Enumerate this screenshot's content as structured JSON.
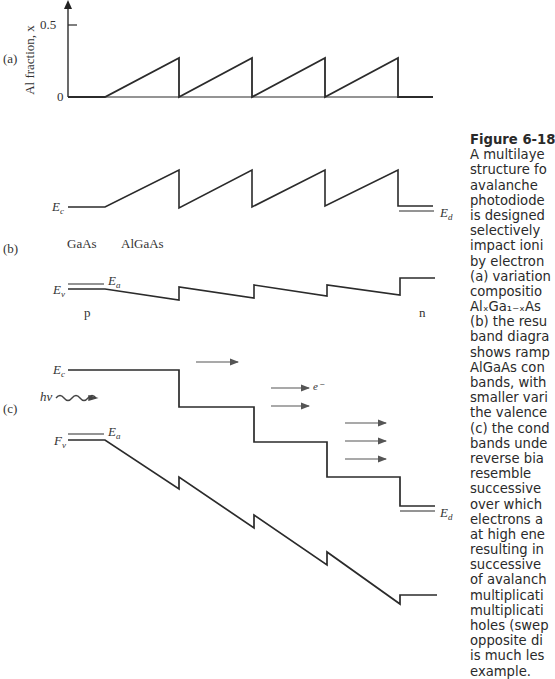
{
  "panel_a": {
    "label": "(a)",
    "ylabel": "Al fraction, x",
    "tick_half": "0.5",
    "tick_zero": "0"
  },
  "panel_b": {
    "label": "(b)",
    "Ec": "E",
    "Ec_sub": "c",
    "Ev": "E",
    "Ev_sub": "v",
    "Ea": "E",
    "Ea_sub": "a",
    "Ed": "E",
    "Ed_sub": "d",
    "region_gaas": "GaAs",
    "region_algaas": "AlGaAs",
    "region_p": "p",
    "region_n": "n"
  },
  "panel_c": {
    "label": "(c)",
    "Ec": "E",
    "Ec_sub": "c",
    "Ev": "F",
    "Ev_sub": "v",
    "Ea": "E",
    "Ea_sub": "a",
    "Ed": "E",
    "Ed_sub": "d",
    "photon": "hν",
    "electron": "e⁻"
  },
  "caption": {
    "title": "Figure 6-18",
    "lines": [
      "A multilaye",
      "structure fo",
      "avalanche",
      "photodiode",
      "is designed",
      "selectively",
      "impact ioni",
      "by electron",
      "(a) variation",
      "compositio",
      "AlₓGa₁₋ₓAs",
      "(b) the resu",
      "band diagra",
      "shows ramp",
      "AlGaAs con",
      "bands, with",
      "smaller vari",
      "the valence",
      "(c) the cond",
      "bands unde",
      "reverse bia",
      "resemble",
      "successive",
      "over which",
      "electrons a",
      "at high ene",
      "resulting in",
      "successive",
      "of avalanch",
      "multiplicati",
      "multiplicati",
      "holes (swep",
      "opposite di",
      "is much les",
      "example."
    ]
  },
  "colors": {
    "line": "#2b2b2b",
    "arrow": "#555555",
    "text": "#2a2a2a"
  }
}
